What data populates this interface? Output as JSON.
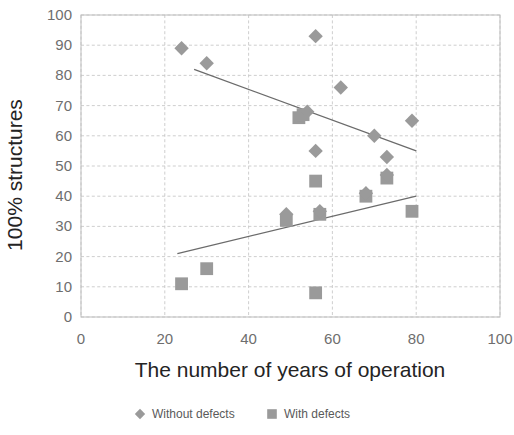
{
  "chart_data": {
    "type": "scatter",
    "title": "",
    "xlabel": "The number of years of operation",
    "ylabel": "100% structures",
    "xlim": [
      0,
      100
    ],
    "ylim": [
      0,
      100
    ],
    "xticks": [
      0,
      20,
      40,
      60,
      80,
      100
    ],
    "yticks": [
      0,
      10,
      20,
      30,
      40,
      50,
      60,
      70,
      80,
      90,
      100
    ],
    "grid": true,
    "legend_position": "bottom",
    "marker_color": "#9a9a9a",
    "trendline_color": "#6b6b6b",
    "gridline_color": "#c8c8c8",
    "series": [
      {
        "name": "Without defects",
        "marker": "diamond",
        "color": "#9a9a9a",
        "points": [
          {
            "x": 24,
            "y": 89
          },
          {
            "x": 30,
            "y": 84
          },
          {
            "x": 49,
            "y": 34
          },
          {
            "x": 54,
            "y": 68
          },
          {
            "x": 56,
            "y": 93
          },
          {
            "x": 56,
            "y": 55
          },
          {
            "x": 57,
            "y": 35
          },
          {
            "x": 62,
            "y": 76
          },
          {
            "x": 68,
            "y": 41
          },
          {
            "x": 70,
            "y": 60
          },
          {
            "x": 73,
            "y": 53
          },
          {
            "x": 73,
            "y": 47
          },
          {
            "x": 79,
            "y": 65
          }
        ],
        "trendline": {
          "x1": 27,
          "y1": 82,
          "x2": 80,
          "y2": 55
        }
      },
      {
        "name": "With defects",
        "marker": "square",
        "color": "#9a9a9a",
        "points": [
          {
            "x": 24,
            "y": 11
          },
          {
            "x": 30,
            "y": 16
          },
          {
            "x": 49,
            "y": 32
          },
          {
            "x": 52,
            "y": 66
          },
          {
            "x": 53,
            "y": 67
          },
          {
            "x": 56,
            "y": 45
          },
          {
            "x": 56,
            "y": 8
          },
          {
            "x": 57,
            "y": 34
          },
          {
            "x": 68,
            "y": 40
          },
          {
            "x": 73,
            "y": 46
          },
          {
            "x": 79,
            "y": 35
          }
        ],
        "trendline": {
          "x1": 23,
          "y1": 21,
          "x2": 80,
          "y2": 40
        }
      }
    ]
  },
  "axes": {
    "x_title": "The number of years of operation",
    "y_title": "100% structures",
    "x_tick_labels": [
      "0",
      "20",
      "40",
      "60",
      "80",
      "100"
    ],
    "y_tick_labels": [
      "0",
      "10",
      "20",
      "30",
      "40",
      "50",
      "60",
      "70",
      "80",
      "90",
      "100"
    ]
  },
  "legend": {
    "items": [
      {
        "label": "Without defects",
        "marker": "diamond"
      },
      {
        "label": "With defects",
        "marker": "square"
      }
    ]
  }
}
